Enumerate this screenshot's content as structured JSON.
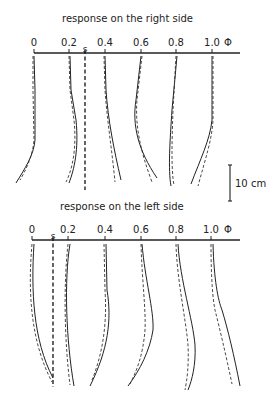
{
  "panels": [
    {
      "title": "response on the right side",
      "title_pos": [
        62,
        22
      ],
      "axis_y": 53,
      "axis_x": [
        34,
        240
      ],
      "phi_label": "Φ",
      "ticks": [
        {
          "label": "0",
          "x": 34
        },
        {
          "label": "0.2",
          "x": 69
        },
        {
          "label": "0.4",
          "x": 105
        },
        {
          "label": "0.6",
          "x": 141
        },
        {
          "label": "0.8",
          "x": 176
        },
        {
          "label": "1.0",
          "x": 212
        }
      ],
      "s_marker": {
        "label": "s",
        "x": 85,
        "y_end": 190
      },
      "curves": [
        {
          "phi": "0",
          "solid": "M34,56 L35,90 L35,140 C34,155 24,170 16,183",
          "dashed": "M33,56 L33,90 L34,140 C33,155 26,170 20,180"
        },
        {
          "phi": "0.2",
          "solid": "M70,56 L71,90 L76,120 C79,150 74,170 69,183",
          "dashed": "M69,56 L70,90 L74,120 C77,150 72,170 66,182"
        },
        {
          "phi": "0.4",
          "solid": "M105,56 L106,90 C108,120 114,150 121,180",
          "dashed": "M104,56 L105,90 C107,120 112,150 115,182"
        },
        {
          "phi": "0.6",
          "solid": "M141,56 L136,100 C132,125 138,150 157,178",
          "dashed": "M142,56 L137,100 C135,125 140,150 152,182"
        },
        {
          "phi": "0.8",
          "solid": "M177,56 L172,110 C170,140 168,170 171,186",
          "dashed": "M176,56 L173,110 C172,140 171,170 174,185"
        },
        {
          "phi": "1.0",
          "solid": "M212,56 L212,120 C210,140 200,160 191,184",
          "dashed": "M213,56 L213,120 C212,140 205,160 198,186"
        }
      ]
    },
    {
      "title": "response on the left side",
      "title_pos": [
        60,
        210
      ],
      "axis_y": 240,
      "axis_x": [
        32,
        240
      ],
      "phi_label": "Φ",
      "ticks": [
        {
          "label": "0",
          "x": 32
        },
        {
          "label": "0.2",
          "x": 68
        },
        {
          "label": "0.4",
          "x": 105
        },
        {
          "label": "0.6",
          "x": 141
        },
        {
          "label": "0.8",
          "x": 176
        },
        {
          "label": "1.0",
          "x": 211
        }
      ],
      "s_marker": {
        "label": "s",
        "x": 53,
        "y_end": 387
      },
      "curves": [
        {
          "phi": "0",
          "solid": "M34,244 C31,290 33,340 53,378",
          "dashed": "M32,244 C28,290 30,340 52,382"
        },
        {
          "phi": "0.2",
          "solid": "M70,244 C64,280 66,340 74,386",
          "dashed": "M68,244 C63,290 65,345 70,385"
        },
        {
          "phi": "0.4",
          "solid": "M106,244 L107,290 C112,320 108,350 90,386",
          "dashed": "M104,244 L105,290 C107,320 104,350 92,380"
        },
        {
          "phi": "0.6",
          "solid": "M142,244 C145,280 154,310 153,330 C150,350 140,370 128,386",
          "dashed": "M141,244 C142,280 146,310 145,330 C143,355 137,370 130,384"
        },
        {
          "phi": "0.8",
          "solid": "M178,244 C180,280 193,320 195,345 C196,365 192,380 188,390",
          "dashed": "M176,244 C177,280 186,320 188,345 C189,365 187,380 185,390"
        },
        {
          "phi": "1.0",
          "solid": "M213,244 C214,280 218,300 222,310 C228,330 234,355 240,386",
          "dashed": "M211,244 C211,280 213,300 215,310 C220,330 226,355 232,384"
        }
      ]
    }
  ],
  "scale_bar": {
    "label": "10 cm",
    "x": 230,
    "y1": 165,
    "y2": 201,
    "label_x": 235,
    "label_y": 187
  }
}
